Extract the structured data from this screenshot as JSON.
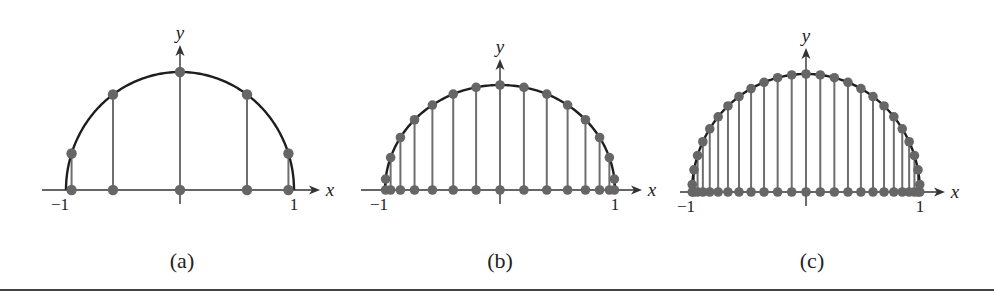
{
  "chart_data": [
    {
      "type": "scatter",
      "title": "(a)",
      "description": "Chebyshev nodes n=5 projected from upper semicircle",
      "xlabel": "x",
      "ylabel": "y",
      "xlim": [
        -1,
        1
      ],
      "ylim": [
        0,
        1
      ],
      "tick_labels": [
        "-1",
        "1"
      ],
      "n": 5,
      "x": [
        -0.9511,
        -0.5878,
        0.0,
        0.5878,
        0.9511
      ],
      "y": [
        0.309,
        0.809,
        1.0,
        0.809,
        0.309
      ],
      "curve": "y = sqrt(1 - x^2)",
      "grid": false,
      "legend": false
    },
    {
      "type": "scatter",
      "title": "(b)",
      "description": "Chebyshev nodes n=15 projected from upper semicircle",
      "xlabel": "x",
      "ylabel": "y",
      "xlim": [
        -1,
        1
      ],
      "ylim": [
        0,
        1
      ],
      "tick_labels": [
        "-1",
        "1"
      ],
      "n": 15,
      "x": [
        -0.9945,
        -0.9511,
        -0.866,
        -0.7431,
        -0.5878,
        -0.4067,
        -0.2079,
        0.0,
        0.2079,
        0.4067,
        0.5878,
        0.7431,
        0.866,
        0.9511,
        0.9945
      ],
      "y": [
        0.1045,
        0.309,
        0.5,
        0.6691,
        0.809,
        0.9135,
        0.9781,
        1.0,
        0.9781,
        0.9135,
        0.809,
        0.6691,
        0.5,
        0.309,
        0.1045
      ],
      "curve": "y = sqrt(1 - x^2)",
      "grid": false,
      "legend": false
    },
    {
      "type": "scatter",
      "title": "(c)",
      "description": "Chebyshev nodes n=25 projected from upper semicircle",
      "xlabel": "x",
      "ylabel": "y",
      "xlim": [
        -1,
        1
      ],
      "ylim": [
        0,
        1
      ],
      "tick_labels": [
        "-1",
        "1"
      ],
      "n": 25,
      "x": [
        -0.998,
        -0.9823,
        -0.9511,
        -0.9048,
        -0.8443,
        -0.7705,
        -0.6845,
        -0.5878,
        -0.4818,
        -0.3681,
        -0.2487,
        -0.1253,
        0.0,
        0.1253,
        0.2487,
        0.3681,
        0.4818,
        0.5878,
        0.6845,
        0.7705,
        0.8443,
        0.9048,
        0.9511,
        0.9823,
        0.998
      ],
      "y": [
        0.0628,
        0.1874,
        0.309,
        0.4258,
        0.5358,
        0.6374,
        0.729,
        0.809,
        0.8763,
        0.9298,
        0.9686,
        0.9921,
        1.0,
        0.9921,
        0.9686,
        0.9298,
        0.8763,
        0.809,
        0.729,
        0.6374,
        0.5358,
        0.4258,
        0.309,
        0.1874,
        0.0628
      ],
      "curve": "y = sqrt(1 - x^2)",
      "grid": false,
      "legend": false
    }
  ],
  "panels": [
    {
      "label": "(a)",
      "x_axis_label": "x",
      "y_axis_label": "y",
      "tick_left": "−1",
      "tick_right": "1"
    },
    {
      "label": "(b)",
      "x_axis_label": "x",
      "y_axis_label": "y",
      "tick_left": "−1",
      "tick_right": "1"
    },
    {
      "label": "(c)",
      "x_axis_label": "x",
      "y_axis_label": "y",
      "tick_left": "−1",
      "tick_right": "1"
    }
  ],
  "colors": {
    "curve": "#1e1e1e",
    "stem": "#6e6e6e",
    "dot": "#666666",
    "axis": "#333333",
    "rule": "#444444"
  }
}
